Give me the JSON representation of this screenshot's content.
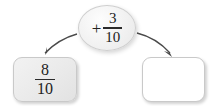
{
  "diagram": {
    "type": "fraction-addition-flow",
    "background_color": "#ffffff",
    "ink_color": "#222222",
    "arrow_color": "#4a4a4a"
  },
  "start_box": {
    "label": "start-value",
    "numerator": "8",
    "denominator": "10",
    "fill_color": "#eaeaea"
  },
  "operator_bubble": {
    "sign": "+",
    "numerator": "3",
    "denominator": "10",
    "fill_color": "#f3f3f3"
  },
  "result_box": {
    "label": "answer-blank",
    "value": "",
    "fill_color": "#ffffff"
  },
  "arrows": [
    {
      "name": "arrow-to-start-box",
      "direction": "down-left"
    },
    {
      "name": "arrow-to-result-box",
      "direction": "down-right"
    }
  ]
}
